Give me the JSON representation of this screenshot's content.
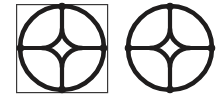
{
  "image": {
    "width": 224,
    "height": 99,
    "background_color": "#ffffff",
    "ink_color": "#1f1d1d",
    "frame_color": "#3a3838",
    "description": "Two monochrome line-art diagrams side by side: a circle enclosing a four-pointed star (astroid) with four radial spokes to boundary nodes. The left copy is circumscribed by a thin square frame."
  },
  "figures": [
    {
      "id": "figure-left",
      "name": "circle-in-square-astroid",
      "has_square_frame": true,
      "frame": {
        "x": 16,
        "y": 4,
        "width": 92,
        "height": 89,
        "stroke_width": 1.2,
        "color": "#3a3838"
      },
      "circle": {
        "center_x": 62,
        "center_y": 48,
        "radius": 42,
        "stroke_width": 4.6,
        "color": "#1f1d1d"
      },
      "astroid": {
        "center_x": 62,
        "center_y": 48,
        "point_radius": 19,
        "concavity": 0.52,
        "stroke_width": 4.6,
        "points": 4
      },
      "nodes": [
        {
          "label": "north",
          "x": 62,
          "y": 6,
          "radius": 3.6
        },
        {
          "label": "east",
          "x": 104,
          "y": 48,
          "radius": 3.6
        },
        {
          "label": "south",
          "x": 62,
          "y": 90,
          "radius": 3.6
        },
        {
          "label": "west",
          "x": 20,
          "y": 48,
          "radius": 3.6
        }
      ],
      "spokes": [
        {
          "label": "north-spoke",
          "from_x": 62,
          "from_y": 6,
          "to_x": 62,
          "to_y": 29
        },
        {
          "label": "east-spoke",
          "from_x": 104,
          "from_y": 48,
          "to_x": 81,
          "to_y": 48
        },
        {
          "label": "south-spoke",
          "from_x": 62,
          "from_y": 90,
          "to_x": 62,
          "to_y": 67
        },
        {
          "label": "west-spoke",
          "from_x": 20,
          "from_y": 48,
          "to_x": 43,
          "to_y": 48
        }
      ]
    },
    {
      "id": "figure-right",
      "name": "circle-astroid",
      "has_square_frame": false,
      "frame": null,
      "circle": {
        "center_x": 170,
        "center_y": 48,
        "radius": 42,
        "stroke_width": 4.6,
        "color": "#1f1d1d"
      },
      "astroid": {
        "center_x": 170,
        "center_y": 48,
        "point_radius": 19,
        "concavity": 0.52,
        "stroke_width": 4.6,
        "points": 4
      },
      "nodes": [
        {
          "label": "north",
          "x": 170,
          "y": 6,
          "radius": 3.6
        },
        {
          "label": "east",
          "x": 212,
          "y": 48,
          "radius": 3.6
        },
        {
          "label": "south",
          "x": 170,
          "y": 90,
          "radius": 3.6
        },
        {
          "label": "west",
          "x": 128,
          "y": 48,
          "radius": 3.6
        }
      ],
      "spokes": [
        {
          "label": "north-spoke",
          "from_x": 170,
          "from_y": 6,
          "to_x": 170,
          "to_y": 29
        },
        {
          "label": "east-spoke",
          "from_x": 212,
          "from_y": 48,
          "to_x": 189,
          "to_y": 48
        },
        {
          "label": "south-spoke",
          "from_x": 170,
          "from_y": 90,
          "to_x": 170,
          "to_y": 67
        },
        {
          "label": "west-spoke",
          "from_x": 128,
          "from_y": 48,
          "to_x": 147,
          "to_y": 48
        }
      ]
    }
  ]
}
